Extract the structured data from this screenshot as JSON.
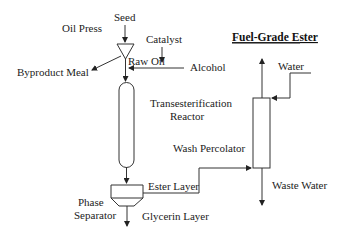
{
  "title": "Fuel-Grade Ester",
  "units": {
    "oil_press": "Oil Press",
    "reactor_line1": "Transesterification",
    "reactor_line2": "Reactor",
    "separator_line1": "Phase",
    "separator_line2": "Separator",
    "percolator": "Wash Percolator"
  },
  "streams": {
    "seed": "Seed",
    "catalyst": "Catalyst",
    "raw_oil": "Raw Oil",
    "alcohol": "Alcohol",
    "byproduct": "Byproduct Meal",
    "ester_layer": "Ester Layer",
    "glycerin_layer": "Glycerin Layer",
    "water": "Water",
    "waste_water": "Waste Water"
  },
  "colors": {
    "line": "#333333",
    "text": "#222222",
    "background": "#ffffff"
  }
}
